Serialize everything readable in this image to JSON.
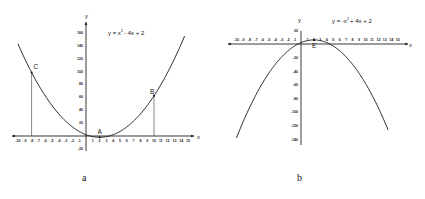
{
  "chart_data": [
    {
      "id": "a",
      "type": "line",
      "caption": "a",
      "title": "y = x² - 4x + 2",
      "equation_main": "y = x",
      "equation_exp": "2",
      "equation_rest": "- 4x + 2",
      "xlabel": "x",
      "ylabel": "y",
      "xlim": [
        -10,
        15
      ],
      "ylim": [
        -20,
        160
      ],
      "x_ticks": [
        -10,
        -9,
        -8,
        -7,
        -6,
        -5,
        -4,
        -3,
        -2,
        -1,
        1,
        2,
        3,
        4,
        5,
        6,
        7,
        8,
        9,
        10,
        11,
        12,
        13,
        14,
        15
      ],
      "y_ticks": [
        160,
        140,
        120,
        100,
        80,
        60,
        40,
        20,
        -20
      ],
      "grid": false,
      "function": {
        "a": 1,
        "b": -4,
        "c": 2
      },
      "x_range": [
        -10,
        14.5
      ],
      "points": [
        {
          "label": "A",
          "x": 2,
          "y": -2
        },
        {
          "label": "B",
          "x": 10,
          "y": 62
        },
        {
          "label": "C",
          "x": -8,
          "y": 98
        }
      ]
    },
    {
      "id": "b",
      "type": "line",
      "caption": "b",
      "title": "y = -x² + 4x + 2",
      "equation_main": "y = -x",
      "equation_exp": "2",
      "equation_rest": "+ 4x + 2",
      "xlabel": "x",
      "ylabel": "y",
      "xlim": [
        -10,
        15
      ],
      "ylim": [
        -140,
        20
      ],
      "x_ticks": [
        -10,
        -9,
        -8,
        -7,
        -6,
        -5,
        -4,
        -3,
        -2,
        -1,
        1,
        2,
        3,
        4,
        5,
        6,
        7,
        8,
        9,
        10,
        11,
        12,
        13,
        14,
        15
      ],
      "y_ticks": [
        20,
        -20,
        -40,
        -60,
        -80,
        -100,
        -120,
        -140
      ],
      "grid": false,
      "function": {
        "a": -1,
        "b": 4,
        "c": 2
      },
      "x_range": [
        -10,
        13.5
      ],
      "points": [
        {
          "label": "E",
          "x": 2,
          "y": 6
        }
      ]
    }
  ]
}
